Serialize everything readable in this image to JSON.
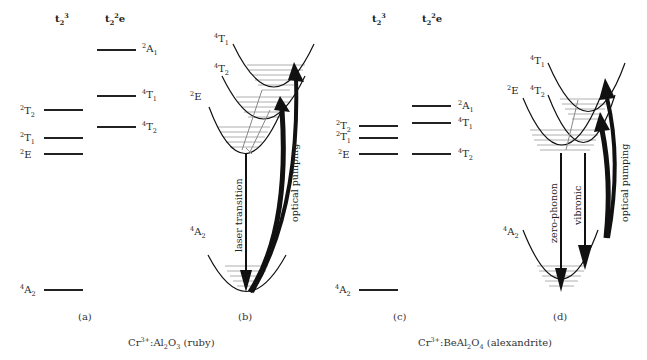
{
  "panels": {
    "a": {
      "label": "(a)",
      "headers": {
        "left": {
          "base": "t",
          "sub": "2",
          "sup": "3"
        },
        "right": {
          "base": "t",
          "sub": "2",
          "sup": "2",
          "tail": "e"
        }
      },
      "left_levels": [
        {
          "sup": "2",
          "base": "T",
          "sub": "2",
          "y": 110
        },
        {
          "sup": "2",
          "base": "T",
          "sub": "1",
          "y": 138
        },
        {
          "sup": "2",
          "base": "E",
          "sub": "",
          "y": 154
        },
        {
          "sup": "4",
          "base": "A",
          "sub": "2",
          "y": 290
        }
      ],
      "right_levels": [
        {
          "sup": "2",
          "base": "A",
          "sub": "1",
          "y": 50
        },
        {
          "sup": "4",
          "base": "T",
          "sub": "1",
          "y": 96
        },
        {
          "sup": "4",
          "base": "T",
          "sub": "2",
          "y": 127
        }
      ]
    },
    "b": {
      "label": "(b)",
      "curves": [
        {
          "sup": "4",
          "base": "T",
          "sub": "1"
        },
        {
          "sup": "4",
          "base": "T",
          "sub": "2"
        },
        {
          "sup": "2",
          "base": "E",
          "sub": ""
        },
        {
          "sup": "4",
          "base": "A",
          "sub": "2"
        }
      ],
      "arrows": {
        "emission": "laser transition",
        "pump": "optical pumping"
      }
    },
    "c": {
      "label": "(c)",
      "headers": {
        "left": {
          "base": "t",
          "sub": "2",
          "sup": "3"
        },
        "right": {
          "base": "t",
          "sub": "2",
          "sup": "2",
          "tail": "e"
        }
      },
      "left_levels": [
        {
          "sup": "2",
          "base": "T",
          "sub": "2",
          "y": 126
        },
        {
          "sup": "2",
          "base": "T",
          "sub": "1",
          "y": 138
        },
        {
          "sup": "2",
          "base": "E",
          "sub": "",
          "y": 154
        },
        {
          "sup": "4",
          "base": "A",
          "sub": "2",
          "y": 290
        }
      ],
      "right_levels": [
        {
          "sup": "2",
          "base": "A",
          "sub": "1",
          "y": 106
        },
        {
          "sup": "4",
          "base": "T",
          "sub": "1",
          "y": 123
        },
        {
          "sup": "4",
          "base": "T",
          "sub": "2",
          "y": 154
        }
      ]
    },
    "d": {
      "label": "(d)",
      "curves": [
        {
          "sup": "4",
          "base": "T",
          "sub": "1"
        },
        {
          "sup": "4",
          "base": "T",
          "sub": "2"
        },
        {
          "sup": "2",
          "base": "E",
          "sub": ""
        },
        {
          "sup": "4",
          "base": "A",
          "sub": "2"
        }
      ],
      "arrows": {
        "emission_1": "zero-phonon",
        "emission_2": "vibronic",
        "pump": "optical pumping"
      }
    }
  },
  "captions": {
    "ruby": {
      "pre": "Cr",
      "sup": "3+",
      "mid": ":Al",
      "sub1": "2",
      "o": "O",
      "sub2": "3",
      "post": " (ruby)"
    },
    "alexandrite": {
      "pre": "Cr",
      "sup": "3+",
      "mid": ":BeAl",
      "sub1": "2",
      "o": "O",
      "sub2": "4",
      "post": " (alexandrite)"
    }
  }
}
